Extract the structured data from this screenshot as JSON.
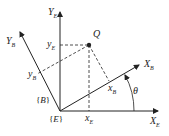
{
  "diagram": {
    "type": "coordinate-frame-rotation",
    "point": {
      "label": "Q"
    },
    "frame_E": {
      "label": "{E}",
      "x_axis": {
        "main": "X",
        "sub": "E"
      },
      "y_axis": {
        "main": "Y",
        "sub": "E"
      },
      "x_coord": {
        "main": "x",
        "sub": "E"
      },
      "y_coord": {
        "main": "y",
        "sub": "E"
      }
    },
    "frame_B": {
      "label": "{B}",
      "x_axis": {
        "main": "X",
        "sub": "B"
      },
      "y_axis": {
        "main": "Y",
        "sub": "B"
      },
      "x_coord": {
        "main": "x",
        "sub": "B"
      },
      "y_coord": {
        "main": "y",
        "sub": "B"
      }
    },
    "angle": {
      "label": "θ"
    },
    "colors": {
      "stroke": "#222222",
      "background": "#ffffff"
    }
  }
}
